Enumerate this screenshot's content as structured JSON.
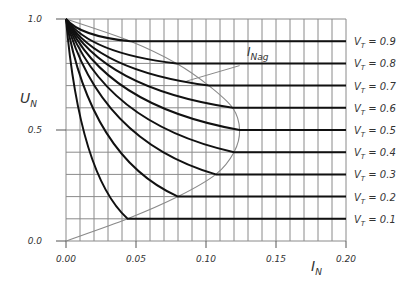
{
  "chart_data": {
    "type": "line",
    "title": "",
    "xlabel": "I_N",
    "ylabel": "U_N",
    "xlim": [
      0.0,
      0.2
    ],
    "ylim": [
      0.0,
      1.0
    ],
    "grid": true,
    "grid_x_step": 0.01,
    "grid_y_step": 0.1,
    "x_ticks": [
      "0.00",
      "0.05",
      "0.10",
      "0.15",
      "0.20"
    ],
    "y_ticks": [
      "0.0",
      "0.5",
      "1.0"
    ],
    "series": [
      {
        "name": "V_T = 0.9",
        "vt": 0.9,
        "end_I": 0.046
      },
      {
        "name": "V_T = 0.8",
        "vt": 0.8,
        "end_I": 0.079
      },
      {
        "name": "V_T = 0.7",
        "vt": 0.7,
        "end_I": 0.102
      },
      {
        "name": "V_T = 0.6",
        "vt": 0.6,
        "end_I": 0.119
      },
      {
        "name": "V_T = 0.5",
        "vt": 0.5,
        "end_I": 0.124
      },
      {
        "name": "V_T = 0.4",
        "vt": 0.4,
        "end_I": 0.12
      },
      {
        "name": "V_T = 0.3",
        "vt": 0.3,
        "end_I": 0.107
      },
      {
        "name": "V_T = 0.2",
        "vt": 0.2,
        "end_I": 0.08
      },
      {
        "name": "V_T = 0.1",
        "vt": 0.1,
        "end_I": 0.044
      }
    ],
    "envelope": {
      "name": "I_Nag",
      "points": [
        [
          0.0,
          0.0
        ],
        [
          0.044,
          0.1
        ],
        [
          0.08,
          0.2
        ],
        [
          0.107,
          0.3
        ],
        [
          0.12,
          0.4
        ],
        [
          0.124,
          0.5
        ],
        [
          0.119,
          0.6
        ],
        [
          0.102,
          0.7
        ],
        [
          0.079,
          0.8
        ],
        [
          0.046,
          0.9
        ],
        [
          0.0,
          1.0
        ]
      ]
    },
    "annotations": [
      {
        "text": "I_Nag",
        "x": 0.128,
        "y": 0.77
      }
    ],
    "legend_position": "right"
  },
  "labels": {
    "x_main": "I",
    "x_sub": "N",
    "y_main": "U",
    "y_sub": "N",
    "annot_main": "I",
    "annot_sub": "Nag",
    "legend_prefix": "V",
    "legend_sub": "T"
  }
}
